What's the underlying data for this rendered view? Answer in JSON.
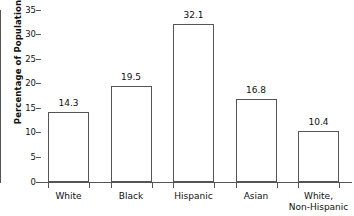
{
  "chart_data": {
    "type": "bar",
    "title": "",
    "xlabel": "",
    "ylabel": "Percentage of Population",
    "ylim": [
      0,
      35
    ],
    "grid": false,
    "legend": null,
    "categories": [
      "White",
      "Black",
      "Hispanic",
      "Asian",
      "White, Non-Hispanic"
    ],
    "category_lines": [
      [
        "White"
      ],
      [
        "Black"
      ],
      [
        "Hispanic"
      ],
      [
        "Asian"
      ],
      [
        "White,",
        "Non-Hispanic"
      ]
    ],
    "values": [
      14.3,
      19.5,
      32.1,
      16.8,
      10.4
    ],
    "value_labels": [
      "14.3",
      "19.5",
      "32.1",
      "16.8",
      "10.4"
    ],
    "y_ticks": [
      0,
      5,
      10,
      15,
      20,
      25,
      30,
      35
    ],
    "y_tick_labels": [
      "0",
      "5",
      "10",
      "15",
      "20",
      "25",
      "30",
      "35"
    ],
    "colors": {
      "bar_fill": "#ffffff",
      "bar_stroke": "#555555",
      "axis": "#555555",
      "text": "#111111",
      "background": "#ffffff"
    }
  }
}
